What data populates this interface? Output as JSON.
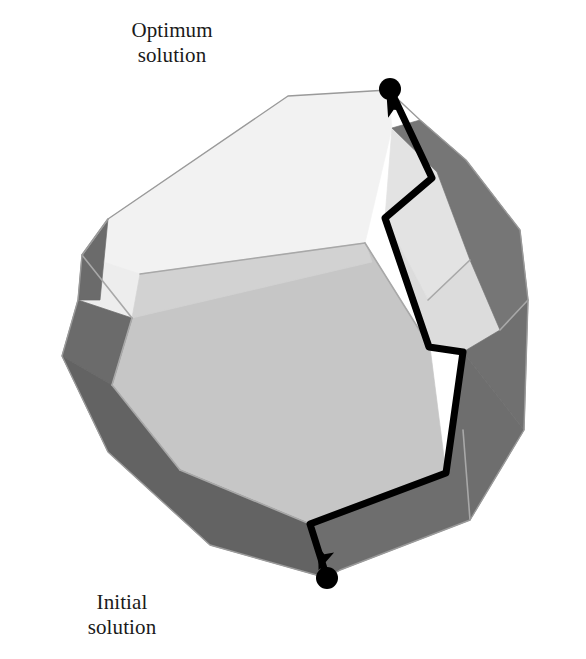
{
  "figure": {
    "background_color": "#ffffff",
    "labels": {
      "optimum": {
        "line1": "Optimum",
        "line2": "solution",
        "marker_name": "optimum-solution-vertex-dot",
        "marker_color": "#000000",
        "marker_position": {
          "x": 390,
          "y": 89
        },
        "marker_radius": 11
      },
      "initial": {
        "line1": "Initial",
        "line2": "solution",
        "marker_name": "initial-solution-vertex-dot",
        "marker_color": "#000000",
        "marker_position": {
          "x": 327,
          "y": 578
        },
        "marker_radius": 11
      }
    },
    "colors": {
      "face_top_light": "#f2f2f2",
      "face_top_light_2": "#ededed",
      "face_front_main": "#c6c6c6",
      "face_front_upper": "#d2d2d2",
      "face_right_light": "#e3e3e3",
      "face_right_light_2": "#dcdcdc",
      "face_left_dark": "#6b6b6b",
      "face_bottom_dark": "#636363",
      "face_right_dark": "#767676",
      "face_right_dark_2": "#707070",
      "face_bottom_right_dark": "#6e6e6e",
      "edge_line": "#a8a8a8",
      "path_line": "#000000"
    },
    "path": {
      "name": "simplex-traversal-path",
      "stroke_width": 7,
      "color": "#000000",
      "description": "Black polyline from initial solution vertex up along polytope edges to optimum solution vertex, with arrowheads",
      "points": [
        {
          "x": 327,
          "y": 578
        },
        {
          "x": 310,
          "y": 524
        },
        {
          "x": 446,
          "y": 473
        },
        {
          "x": 463,
          "y": 352
        },
        {
          "x": 429,
          "y": 347
        },
        {
          "x": 385,
          "y": 218
        },
        {
          "x": 432,
          "y": 178
        },
        {
          "x": 390,
          "y": 89
        }
      ],
      "arrowheads": [
        {
          "name": "arrowhead-upper",
          "x": 392,
          "y": 106,
          "angle_deg": -25
        },
        {
          "name": "arrowhead-lower",
          "x": 323,
          "y": 558,
          "angle_deg": 200
        }
      ]
    },
    "polytope": {
      "name": "convex-polytope",
      "faces": [
        {
          "id": "top-light-large",
          "fill_key": "face_top_light",
          "points": "288,96 388,90 392,128 365,243 140,274 82,255 108,219"
        },
        {
          "id": "top-light-left-sliver",
          "fill_key": "face_top_light_2",
          "points": "82,255 140,274 132,318 78,300"
        },
        {
          "id": "front-main",
          "fill_key": "face_front_main",
          "points": "132,318 365,243 430,347 446,473 310,524 180,470 112,385"
        },
        {
          "id": "front-upper-band",
          "fill_key": "face_front_upper",
          "points": "140,274 365,243 372,262 132,318"
        },
        {
          "id": "right-light-upper",
          "fill_key": "face_right_light",
          "points": "392,128 437,172 470,260 428,300 385,218"
        },
        {
          "id": "right-light-lower",
          "fill_key": "face_right_light_2",
          "points": "385,218 428,300 470,260 500,330 463,352 429,347"
        },
        {
          "id": "left-dark-upper",
          "fill_key": "face_left_dark",
          "points": "82,255 108,219 100,300 78,300"
        },
        {
          "id": "left-dark-mid",
          "fill_key": "face_left_dark",
          "points": "78,300 132,318 112,385 62,356"
        },
        {
          "id": "bottom-left-dark",
          "fill_key": "face_bottom_dark",
          "points": "62,356 112,385 180,470 310,524 327,578 210,545 108,452"
        },
        {
          "id": "right-dark-upper",
          "fill_key": "face_right_dark",
          "points": "392,128 437,172 470,260 500,330 528,300 520,230 466,160 420,120"
        },
        {
          "id": "right-dark-lower",
          "fill_key": "face_right_dark_2",
          "points": "500,330 528,300 524,430 463,352"
        },
        {
          "id": "bottom-right-dark",
          "fill_key": "face_bottom_right_dark",
          "points": "446,473 463,352 524,430 470,520 340,570 327,578 310,524"
        }
      ],
      "interior_edges": [
        {
          "id": "edge-top-ridge",
          "points": "140,274 365,243"
        },
        {
          "id": "edge-left-crease",
          "points": "82,255 132,318"
        },
        {
          "id": "edge-front-left",
          "points": "132,318 112,385"
        },
        {
          "id": "edge-front-bottomleft",
          "points": "112,385 180,470"
        },
        {
          "id": "edge-front-bottom",
          "points": "180,470 310,524"
        },
        {
          "id": "edge-top-left-fold",
          "points": "108,219 82,255"
        },
        {
          "id": "edge-right-fold-a",
          "points": "470,260 428,300"
        },
        {
          "id": "edge-right-fold-b",
          "points": "500,330 528,300"
        },
        {
          "id": "edge-bottom-right-fold",
          "points": "470,520 463,430"
        },
        {
          "id": "edge-front-right",
          "points": "365,243 430,347"
        }
      ],
      "outline": "288,96 388,90 420,120 466,160 520,230 528,300 524,430 470,520 340,570 327,578 210,545 108,452 62,356 78,300 82,255 108,219"
    }
  }
}
